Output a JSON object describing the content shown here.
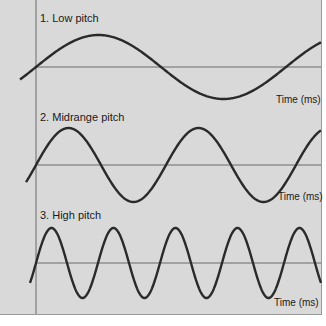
{
  "axis_label": "Time (ms)",
  "waves": [
    {
      "label": "1. Low pitch",
      "cycles_visible": 1.1
    },
    {
      "label": "2. Midrange pitch",
      "cycles_visible": 2.3
    },
    {
      "label": "3. High pitch",
      "cycles_visible": 5.0
    }
  ],
  "colors": {
    "background": "#d9d9d9",
    "wave": "#2a2a2a",
    "axis": "#6a6a6a"
  }
}
